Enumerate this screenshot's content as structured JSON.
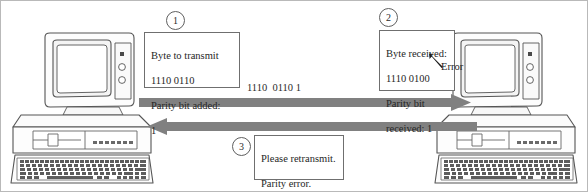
{
  "diagram": {
    "background_color": "#ffffff",
    "ink_color": "#4a4a4a",
    "arrow_color": "#808080"
  },
  "nodes": {
    "sender": {
      "name": "sending-computer",
      "label": ""
    },
    "receiver": {
      "name": "receiving-computer",
      "label": ""
    }
  },
  "steps": [
    {
      "number": "1",
      "lines": [
        "Byte to transmit",
        "1110 0110",
        "Parity bit added:",
        "1"
      ]
    },
    {
      "number": "2",
      "lines": [
        "Byte received:",
        "1110 0100",
        "Parity bit",
        "received: 1"
      ]
    },
    {
      "number": "3",
      "lines": [
        "Please retransmit.",
        "Parity error."
      ]
    }
  ],
  "annotations": {
    "error_label": "Error",
    "transmitted_bits": "1110  0110 1"
  }
}
